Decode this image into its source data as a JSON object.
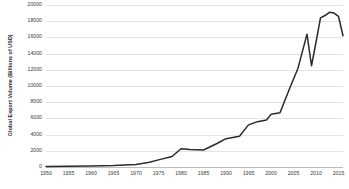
{
  "chart_data": {
    "type": "line",
    "title": "",
    "xlabel": "",
    "ylabel": "Global Export Volume (Billions of USD)",
    "xlim": [
      1950,
      2016
    ],
    "ylim": [
      0,
      20000
    ],
    "grid": true,
    "legend": false,
    "legend_position": "none",
    "line_color": "#2b2b2b",
    "grid_color": "#e3e3e3",
    "axis_color": "#bdbdbd",
    "x_ticks": [
      1950,
      1955,
      1960,
      1965,
      1970,
      1975,
      1980,
      1985,
      1990,
      1995,
      2000,
      2005,
      2010,
      2015
    ],
    "y_ticks": [
      0,
      2000,
      4000,
      6000,
      8000,
      10000,
      12000,
      14000,
      16000,
      18000,
      20000
    ],
    "x_tick_labels": [
      "1950",
      "1955",
      "1960",
      "1965",
      "1970",
      "1975",
      "1980",
      "1985",
      "1990",
      "1995",
      "2000",
      "2005",
      "2010",
      "2015"
    ],
    "y_tick_labels": [
      "0",
      "2000",
      "4000",
      "6000",
      "8000",
      "10000",
      "12000",
      "14000",
      "16000",
      "18000",
      "20000"
    ],
    "series": [
      {
        "name": "Global Export Volume",
        "x": [
          1950,
          1955,
          1960,
          1965,
          1970,
          1973,
          1975,
          1978,
          1980,
          1982,
          1985,
          1988,
          1990,
          1993,
          1995,
          1997,
          1999,
          2000,
          2002,
          2004,
          2006,
          2008,
          2009,
          2010,
          2011,
          2012,
          2013,
          2014,
          2015,
          2016
        ],
        "y": [
          62,
          95,
          130,
          190,
          320,
          580,
          880,
          1300,
          2250,
          2150,
          2100,
          2900,
          3500,
          3800,
          5200,
          5600,
          5800,
          6500,
          6700,
          9500,
          12200,
          16400,
          12500,
          15400,
          18400,
          18700,
          19100,
          19000,
          18600,
          16200
        ]
      }
    ]
  }
}
